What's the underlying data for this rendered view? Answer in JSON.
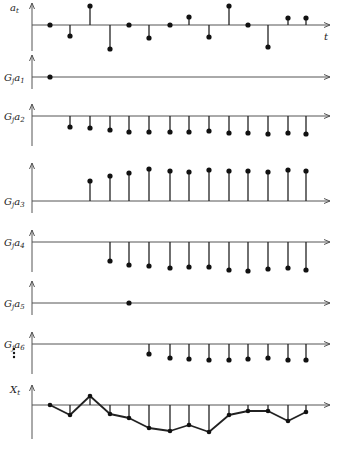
{
  "figure": {
    "x_positions": [
      50,
      70,
      90,
      110,
      129,
      149,
      170,
      189,
      209,
      229,
      248,
      268,
      288,
      306
    ],
    "origin_x": 32,
    "axis_end_x": 330,
    "time_label": "t",
    "ellipsis": "⋮"
  },
  "panels": [
    {
      "id": "a",
      "label": "a",
      "subscript": "t",
      "prefix": "",
      "axis_y": 25,
      "start_index": 0,
      "values": [
        0,
        -11,
        19,
        -24,
        0,
        -13,
        0,
        8,
        -12,
        19,
        0,
        -22,
        7,
        7
      ],
      "show_t": true
    },
    {
      "id": "g1",
      "label": "a",
      "subscript": "1",
      "prefix": "G",
      "prefix_sub": "j",
      "axis_y": 77,
      "start_index": 0,
      "values": [
        0
      ]
    },
    {
      "id": "g2",
      "label": "a",
      "subscript": "2",
      "prefix": "G",
      "prefix_sub": "j",
      "axis_y": 116,
      "start_index": 1,
      "values": [
        -11,
        -12,
        -14,
        -16,
        -16,
        -16,
        -16,
        -15,
        -17,
        -17,
        -18,
        -17,
        -18
      ]
    },
    {
      "id": "g3",
      "label": "a",
      "subscript": "3",
      "prefix": "G",
      "prefix_sub": "j",
      "axis_y": 201,
      "start_index": 2,
      "values": [
        20,
        25,
        28,
        32,
        30,
        29,
        31,
        30,
        30,
        29,
        31,
        30
      ]
    },
    {
      "id": "g4",
      "label": "a",
      "subscript": "4",
      "prefix": "G",
      "prefix_sub": "j",
      "axis_y": 242,
      "start_index": 3,
      "values": [
        -19,
        -23,
        -24,
        -26,
        -25,
        -25,
        -28,
        -29,
        -27,
        -26,
        -28
      ]
    },
    {
      "id": "g5",
      "label": "a",
      "subscript": "5",
      "prefix": "G",
      "prefix_sub": "j",
      "axis_y": 303,
      "start_index": 4,
      "values": [
        0
      ]
    },
    {
      "id": "g6",
      "label": "a",
      "subscript": "6",
      "prefix": "G",
      "prefix_sub": "j",
      "axis_y": 344,
      "start_index": 5,
      "values": [
        -10,
        -14,
        -15,
        -16,
        -16,
        -15,
        -14,
        -16,
        -16
      ]
    },
    {
      "id": "x",
      "label": "X",
      "subscript": "t",
      "prefix": "",
      "axis_y": 405,
      "start_index": 0,
      "values": [
        0,
        -10,
        9,
        -9,
        -13,
        -23,
        -26,
        -20,
        -27,
        -10,
        -6,
        -6,
        -16,
        -7
      ],
      "connected": true
    }
  ],
  "labels": {
    "a_t": "a",
    "a_t_sub": "t",
    "g": "G",
    "g_sub": "j",
    "x_t": "X",
    "x_t_sub": "t",
    "t_axis": "t"
  }
}
